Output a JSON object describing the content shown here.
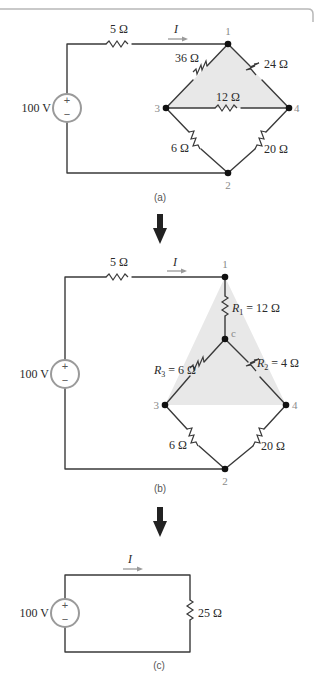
{
  "figure": {
    "panels": [
      {
        "id": "a",
        "caption": "(a)",
        "source": {
          "label": "100 V",
          "plus": "+",
          "minus": "−"
        },
        "current_label": "I",
        "series_resistor": "5 Ω",
        "nodes": {
          "n1": "1",
          "n2": "2",
          "n3": "3",
          "n4": "4"
        },
        "resistors": {
          "r13": "36 Ω",
          "r14": "24 Ω",
          "r34": "12 Ω",
          "r32": "6 Ω",
          "r42": "20 Ω"
        }
      },
      {
        "id": "b",
        "caption": "(b)",
        "source": {
          "label": "100 V",
          "plus": "+",
          "minus": "−"
        },
        "current_label": "I",
        "series_resistor": "5 Ω",
        "nodes": {
          "n1": "1",
          "n2": "2",
          "n3": "3",
          "n4": "4",
          "nc": "c"
        },
        "resistors": {
          "r1_sym": "R",
          "r1_sub": "1",
          "r1_val": " = 12 Ω",
          "r2_sym": "R",
          "r2_sub": "2",
          "r2_val": " = 4 Ω",
          "r3_sym": "R",
          "r3_sub": "3",
          "r3_val": " = 6 Ω",
          "r32": "6 Ω",
          "r42": "20 Ω"
        }
      },
      {
        "id": "c",
        "caption": "(c)",
        "source": {
          "label": "100 V",
          "plus": "+",
          "minus": "−"
        },
        "current_label": "I",
        "load_resistor": "25 Ω"
      }
    ]
  }
}
